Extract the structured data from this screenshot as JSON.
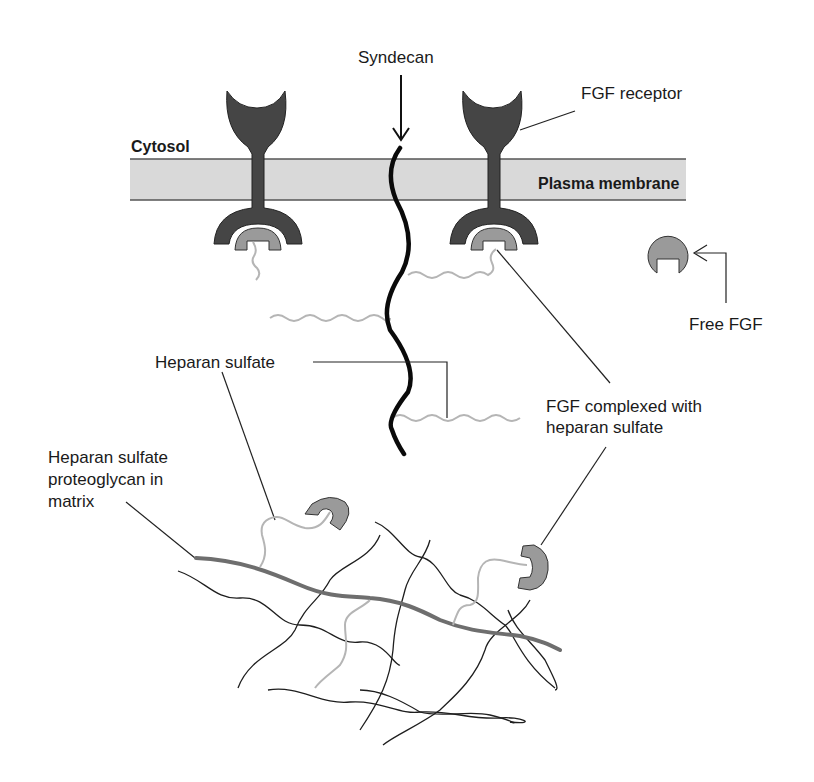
{
  "diagram": {
    "type": "biology-schematic",
    "colors": {
      "membrane_fill": "#d9d9d9",
      "membrane_border": "#555555",
      "receptor": "#454545",
      "fgf": "#9a9a9a",
      "heparan_sulfate_chain": "#b5b5b5",
      "syndecan": "#0a0a0a",
      "matrix_core": "#6e6e6e",
      "matrix_fibers": "#1e1e1e",
      "leader_line": "#222222"
    },
    "regions": {
      "cytosol": "Cytosol",
      "plasma_membrane": "Plasma membrane"
    },
    "labels": {
      "syndecan": "Syndecan",
      "fgf_receptor": "FGF receptor",
      "free_fgf": "Free FGF",
      "heparan_sulfate": "Heparan sulfate",
      "fgf_complexed_line1": "FGF complexed with",
      "fgf_complexed_line2": "heparan sulfate",
      "hspg_line1": "Heparan sulfate",
      "hspg_line2": "proteoglycan in",
      "hspg_line3": "matrix"
    },
    "components": [
      {
        "id": "fgf-receptor-left",
        "name": "FGF receptor (with bound FGF)"
      },
      {
        "id": "fgf-receptor-right",
        "name": "FGF receptor (with bound FGF)"
      },
      {
        "id": "syndecan",
        "name": "Syndecan core protein"
      },
      {
        "id": "free-fgf",
        "name": "Free FGF"
      },
      {
        "id": "matrix-proteoglycan",
        "name": "Heparan sulfate proteoglycan in matrix"
      },
      {
        "id": "matrix-fgf-1",
        "name": "FGF bound to matrix heparan sulfate"
      },
      {
        "id": "matrix-fgf-2",
        "name": "FGF bound to matrix heparan sulfate"
      }
    ]
  }
}
